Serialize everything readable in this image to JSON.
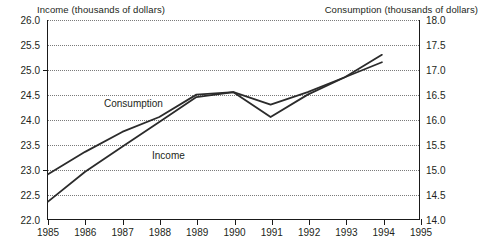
{
  "chart_data": {
    "type": "line",
    "title": "",
    "subtitle": "",
    "xlabel": "",
    "ylabel": "Income (thousands of dollars)",
    "y2label": "Consumption (thousands of dollars)",
    "grid": true,
    "legend_position": "inline-annotations",
    "x": [
      1985,
      1986,
      1987,
      1988,
      1989,
      1990,
      1991,
      1992,
      1993,
      1994
    ],
    "xlim": [
      1985,
      1995
    ],
    "xticks": [
      "1985",
      "1986",
      "1987",
      "1988",
      "1989",
      "1990",
      "1991",
      "1992",
      "1993",
      "1994",
      "1995"
    ],
    "ylim": [
      22.0,
      26.0
    ],
    "yticks": [
      "26.0",
      "25.5",
      "25.0",
      "24.5",
      "24.0",
      "23.5",
      "23.0",
      "22.5",
      "22.0"
    ],
    "y2lim": [
      14.0,
      18.0
    ],
    "y2ticks": [
      "18.0",
      "17.5",
      "17.0",
      "16.5",
      "16.0",
      "15.5",
      "15.0",
      "14.5",
      "14.0"
    ],
    "series": [
      {
        "name": "Income",
        "axis": "left",
        "annotation": "Income",
        "values": [
          22.35,
          22.95,
          23.45,
          23.95,
          24.45,
          24.55,
          24.05,
          24.5,
          24.85,
          25.3
        ]
      },
      {
        "name": "Consumption",
        "axis": "right",
        "annotation": "Consumption",
        "values": [
          14.9,
          15.35,
          15.75,
          16.05,
          16.5,
          16.55,
          16.3,
          16.55,
          16.85,
          17.15
        ]
      }
    ]
  },
  "colors": {
    "line": "#2b2b2b",
    "axis": "#1a1a1a",
    "grid": "#7a7a7a",
    "text": "#231f20",
    "background": "#ffffff"
  }
}
